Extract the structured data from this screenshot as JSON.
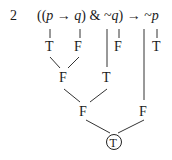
{
  "problem_number": "2",
  "formula": {
    "tokens": [
      "((",
      "p",
      " → ",
      "q",
      ") & ~",
      "q",
      ") → ~",
      "p"
    ],
    "full_text": "((p → q) & ~q) → ~p"
  },
  "tree": {
    "level1": [
      {
        "id": "p1",
        "value": "T"
      },
      {
        "id": "q1",
        "value": "F"
      },
      {
        "id": "q2",
        "value": "F"
      },
      {
        "id": "p2",
        "value": "T"
      }
    ],
    "level2": [
      {
        "id": "impl_pq",
        "value": "F"
      },
      {
        "id": "neg_q",
        "value": "T"
      }
    ],
    "level3": [
      {
        "id": "conj",
        "value": "F"
      },
      {
        "id": "neg_p",
        "value": "F"
      }
    ],
    "root": {
      "id": "main_impl",
      "value": "T",
      "circled": true
    }
  }
}
